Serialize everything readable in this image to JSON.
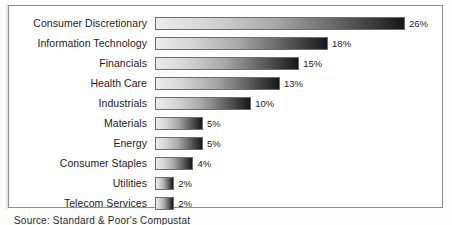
{
  "figure": {
    "source_note": "Source: Standard & Poor's Compustat",
    "frame_border_color": "#8e8e8e",
    "bar_outline_color": "#6d6d6d",
    "bar_gradient_start": "#ececec",
    "bar_gradient_end": "#171717",
    "text_color": "#1d1d1d"
  },
  "chart_data": {
    "type": "bar",
    "orientation": "horizontal",
    "title": "",
    "subtitle": "",
    "xlabel": "",
    "ylabel": "",
    "grid": false,
    "legend": false,
    "value_suffix": "%",
    "xlim": [
      0,
      26
    ],
    "categories": [
      "Consumer Discretionary",
      "Information Technology",
      "Financials",
      "Health Care",
      "Industrials",
      "Materials",
      "Energy",
      "Consumer Staples",
      "Utilities",
      "Telecom Services"
    ],
    "values": [
      26,
      18,
      15,
      13,
      10,
      5,
      5,
      4,
      2,
      2
    ],
    "value_labels": [
      "26%",
      "18%",
      "15%",
      "13%",
      "10%",
      "5%",
      "5%",
      "4%",
      "2%",
      "2%"
    ],
    "bars": [
      {
        "label": "Consumer Discretionary",
        "value": 26,
        "value_label": "26%"
      },
      {
        "label": "Information Technology",
        "value": 18,
        "value_label": "18%"
      },
      {
        "label": "Financials",
        "value": 15,
        "value_label": "15%"
      },
      {
        "label": "Health Care",
        "value": 13,
        "value_label": "13%"
      },
      {
        "label": "Industrials",
        "value": 10,
        "value_label": "10%"
      },
      {
        "label": "Materials",
        "value": 5,
        "value_label": "5%"
      },
      {
        "label": "Energy",
        "value": 5,
        "value_label": "5%"
      },
      {
        "label": "Consumer Staples",
        "value": 4,
        "value_label": "4%"
      },
      {
        "label": "Utilities",
        "value": 2,
        "value_label": "2%"
      },
      {
        "label": "Telecom Services",
        "value": 2,
        "value_label": "2%"
      }
    ]
  }
}
